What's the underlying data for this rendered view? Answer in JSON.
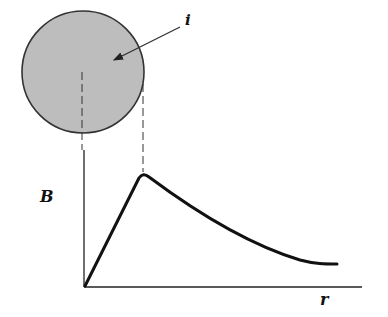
{
  "diagram": {
    "type": "magnetic field of a current-carrying wire vs radius",
    "wire": {
      "current_label": "i",
      "fill_color": "#bdbdbd",
      "outline_color": "#333333"
    },
    "axes": {
      "y_label": "B",
      "x_label": "r"
    },
    "curve": {
      "description": "B rises linearly from origin to wire surface (r = R), then decays ~1/r outside",
      "color": "#111111"
    },
    "guides": {
      "center_dash": "dashed line from wire center down to origin",
      "surface_dash": "dashed line from wire edge down to peak of B"
    }
  }
}
